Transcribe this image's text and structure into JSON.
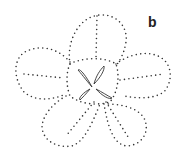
{
  "figure": {
    "panel_label": "b",
    "dot_color": "#333333",
    "line_color": "#333333"
  }
}
